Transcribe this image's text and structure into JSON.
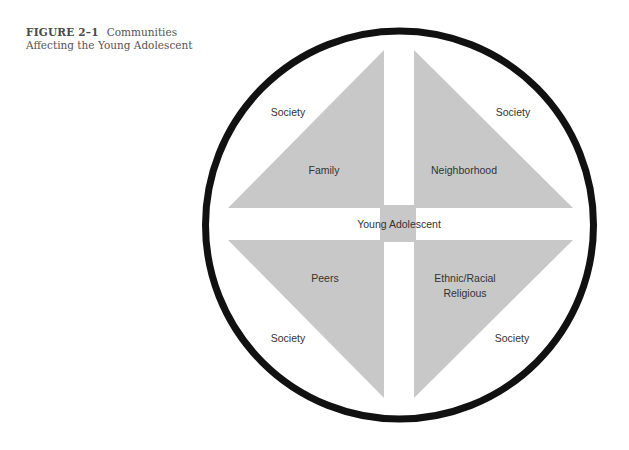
{
  "caption": {
    "figure_number": "FIGURE 2–1",
    "title_line1": "Communities",
    "title_line2": "Affecting the Young Adolescent"
  },
  "diagram": {
    "colors": {
      "fill": "#c8c8c8",
      "ring": "#111111",
      "text": "#333333"
    },
    "center": {
      "label": "Young Adolescent"
    },
    "quadrants": [
      {
        "position": "top-left",
        "inner_label": "Family",
        "outer_label": "Society"
      },
      {
        "position": "top-right",
        "inner_label": "Neighborhood",
        "outer_label": "Society"
      },
      {
        "position": "bottom-left",
        "inner_label": "Peers",
        "outer_label": "Society"
      },
      {
        "position": "bottom-right",
        "inner_label_line1": "Ethnic/Racial",
        "inner_label_line2": "Religious",
        "outer_label": "Society"
      }
    ]
  }
}
